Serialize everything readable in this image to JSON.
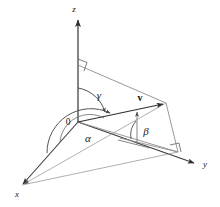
{
  "figure": {
    "background_color": "#ffffff",
    "line_color": "#555555",
    "axis_color": "#3a3a3a",
    "label_color": "#1a1a1a"
  },
  "labels": {
    "axis_z": "z",
    "axis_y": "y",
    "axis_x": "x",
    "origin": "0",
    "angle_alpha": "α",
    "angle_beta": "β",
    "angle_gamma": "γ",
    "vector": "v"
  },
  "geometry": {
    "origin": {
      "x": 78,
      "y": 122
    },
    "z_axis_tip": {
      "x": 78,
      "y": 16
    },
    "y_axis_tip": {
      "x": 198,
      "y": 164
    },
    "x_axis_tip": {
      "x": 20,
      "y": 186
    },
    "vector_tip": {
      "x": 166,
      "y": 103
    },
    "z_foot": {
      "x": 78,
      "y": 65
    },
    "xy_projection_point": {
      "x": 178,
      "y": 152
    },
    "right_angle_marks": [
      {
        "x": 80,
        "y": 65,
        "name": "right-angle-z-axis"
      },
      {
        "x": 178,
        "y": 152,
        "name": "right-angle-xy-plane"
      }
    ]
  },
  "elements": {
    "z_axis_name": "z-axis",
    "y_axis_name": "y-axis",
    "x_axis_name": "x-axis",
    "vector_name": "vector-v",
    "alpha_arc_name": "alpha-arc",
    "beta_arc_name": "beta-arc",
    "gamma_arc_name": "gamma-arc"
  }
}
